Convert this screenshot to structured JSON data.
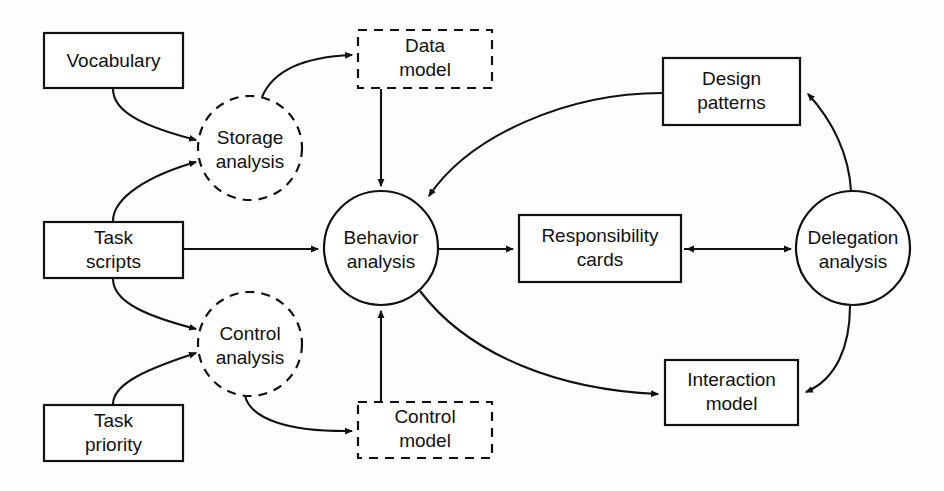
{
  "diagram": {
    "colors": {
      "stroke": "#111111",
      "fill": "#ffffff",
      "background": "#fdfdfd"
    },
    "nodes": {
      "vocabulary": {
        "label": "Vocabulary",
        "line1": "Vocabulary",
        "line2": "",
        "shape": "rectangle",
        "x": 44,
        "y": 33,
        "w": 139,
        "h": 55
      },
      "task_scripts": {
        "label": "Task scripts",
        "line1": "Task",
        "line2": "scripts",
        "shape": "rectangle",
        "x": 44,
        "y": 222,
        "w": 139,
        "h": 56
      },
      "task_priority": {
        "label": "Task priority",
        "line1": "Task",
        "line2": "priority",
        "shape": "rectangle",
        "x": 44,
        "y": 405,
        "w": 139,
        "h": 56
      },
      "storage_analysis": {
        "label": "Storage analysis",
        "line1": "Storage",
        "line2": "analysis",
        "shape": "dashed-circle",
        "cx": 250,
        "cy": 148,
        "r": 52
      },
      "control_analysis": {
        "label": "Control analysis",
        "line1": "Control",
        "line2": "analysis",
        "shape": "dashed-circle",
        "cx": 250,
        "cy": 344,
        "r": 52
      },
      "data_model": {
        "label": "Data model",
        "line1": "Data",
        "line2": "model",
        "shape": "dashed-rectangle",
        "x": 358,
        "y": 30,
        "w": 134,
        "h": 58
      },
      "control_model": {
        "label": "Control model",
        "line1": "Control",
        "line2": "model",
        "shape": "dashed-rectangle",
        "x": 358,
        "y": 402,
        "w": 134,
        "h": 56
      },
      "behavior_analysis": {
        "label": "Behavior analysis",
        "line1": "Behavior",
        "line2": "analysis",
        "shape": "circle",
        "cx": 381,
        "cy": 248,
        "r": 57
      },
      "responsibility_cards": {
        "label": "Responsibility cards",
        "line1": "Responsibility",
        "line2": "cards",
        "shape": "rectangle",
        "x": 519,
        "y": 215,
        "w": 162,
        "h": 67
      },
      "design_patterns": {
        "label": "Design patterns",
        "line1": "Design",
        "line2": "patterns",
        "shape": "rectangle",
        "x": 663,
        "y": 58,
        "w": 137,
        "h": 67
      },
      "interaction_model": {
        "label": "Interaction model",
        "line1": "Interaction",
        "line2": "model",
        "shape": "rectangle",
        "x": 665,
        "y": 360,
        "w": 133,
        "h": 65
      },
      "delegation_analysis": {
        "label": "Delegation analysis",
        "line1": "Delegation",
        "line2": "analysis",
        "shape": "circle",
        "cx": 853,
        "cy": 248,
        "r": 57
      }
    },
    "edges": [
      {
        "id": "vocabulary-to-storage-analysis",
        "from": "vocabulary",
        "to": "storage_analysis",
        "style": "curved"
      },
      {
        "id": "task-scripts-to-storage-analysis",
        "from": "task_scripts",
        "to": "storage_analysis",
        "style": "curved"
      },
      {
        "id": "storage-analysis-to-data-model",
        "from": "storage_analysis",
        "to": "data_model",
        "style": "curved"
      },
      {
        "id": "data-model-to-behavior-analysis",
        "from": "data_model",
        "to": "behavior_analysis",
        "style": "straight"
      },
      {
        "id": "task-scripts-to-behavior-analysis",
        "from": "task_scripts",
        "to": "behavior_analysis",
        "style": "straight"
      },
      {
        "id": "task-scripts-to-control-analysis",
        "from": "task_scripts",
        "to": "control_analysis",
        "style": "curved"
      },
      {
        "id": "task-priority-to-control-analysis",
        "from": "task_priority",
        "to": "control_analysis",
        "style": "curved"
      },
      {
        "id": "control-analysis-to-control-model",
        "from": "control_analysis",
        "to": "control_model",
        "style": "curved"
      },
      {
        "id": "control-model-to-behavior-analysis",
        "from": "control_model",
        "to": "behavior_analysis",
        "style": "straight"
      },
      {
        "id": "behavior-analysis-to-responsibility-cards",
        "from": "behavior_analysis",
        "to": "responsibility_cards",
        "style": "straight"
      },
      {
        "id": "responsibility-cards-to-delegation-analysis",
        "from": "responsibility_cards",
        "to": "delegation_analysis",
        "style": "straight"
      },
      {
        "id": "delegation-analysis-to-responsibility-cards",
        "from": "delegation_analysis",
        "to": "responsibility_cards",
        "style": "straight"
      },
      {
        "id": "delegation-analysis-to-design-patterns",
        "from": "delegation_analysis",
        "to": "design_patterns",
        "style": "curved"
      },
      {
        "id": "design-patterns-to-behavior-analysis",
        "from": "design_patterns",
        "to": "behavior_analysis",
        "style": "curved"
      },
      {
        "id": "behavior-analysis-to-interaction-model",
        "from": "behavior_analysis",
        "to": "interaction_model",
        "style": "curved"
      },
      {
        "id": "delegation-analysis-to-interaction-model",
        "from": "delegation_analysis",
        "to": "interaction_model",
        "style": "curved"
      }
    ]
  }
}
